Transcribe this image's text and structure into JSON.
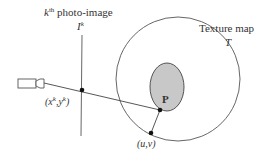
{
  "labels": {
    "photo_image_prefix": "k",
    "photo_image_sup": "th",
    "photo_image_text": " photo-image",
    "image_symbol": "I",
    "image_symbol_sup": "k",
    "texture_map": "Texture map",
    "texture_symbol": "T",
    "point_label": "P",
    "image_coord_open": "(x",
    "image_coord_sup1": "k",
    "image_coord_mid": ",y",
    "image_coord_sup2": "k",
    "image_coord_close": ")",
    "texture_coord": "(u,v)"
  },
  "colors": {
    "stroke": "#444444",
    "surface_fill": "#c8c8c8",
    "text": "#333333"
  }
}
